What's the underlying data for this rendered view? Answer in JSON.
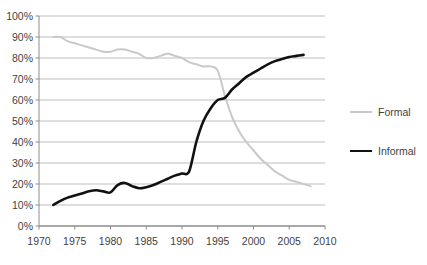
{
  "chart_data": {
    "type": "line",
    "title": "",
    "xlabel": "",
    "ylabel": "",
    "xlim": [
      1970,
      2010
    ],
    "ylim": [
      0,
      100
    ],
    "grid": true,
    "legend_position": "right",
    "x_ticks": [
      "1970",
      "1975",
      "1980",
      "1985",
      "1990",
      "1995",
      "2000",
      "2005",
      "2010"
    ],
    "y_ticks": [
      "0%",
      "10%",
      "20%",
      "30%",
      "40%",
      "50%",
      "60%",
      "70%",
      "80%",
      "90%",
      "100%"
    ],
    "series": [
      {
        "name": "Formal",
        "color": "#c9c9c9",
        "x": [
          1972,
          1973,
          1974,
          1975,
          1976,
          1977,
          1978,
          1979,
          1980,
          1981,
          1982,
          1983,
          1984,
          1985,
          1986,
          1987,
          1988,
          1989,
          1990,
          1991,
          1992,
          1993,
          1994,
          1995,
          1996,
          1997,
          1998,
          1999,
          2000,
          2001,
          2002,
          2003,
          2004,
          2005,
          2006,
          2007,
          2008
        ],
        "values": [
          90,
          90,
          88,
          87,
          86,
          85,
          84,
          83,
          83,
          84,
          84,
          83,
          82,
          80,
          80,
          81,
          82,
          81,
          80,
          78,
          77,
          76,
          76,
          74,
          62,
          52,
          45,
          40,
          36,
          32,
          29,
          26,
          24,
          22,
          21,
          20,
          19
        ]
      },
      {
        "name": "Informal",
        "color": "#111111",
        "x": [
          1972,
          1973,
          1974,
          1975,
          1976,
          1977,
          1978,
          1979,
          1980,
          1981,
          1982,
          1983,
          1984,
          1985,
          1986,
          1987,
          1988,
          1989,
          1990,
          1991,
          1992,
          1993,
          1994,
          1995,
          1996,
          1997,
          1998,
          1999,
          2000,
          2001,
          2002,
          2003,
          2004,
          2005,
          2006,
          2007
        ],
        "values": [
          10,
          12,
          13.5,
          14.5,
          15.5,
          16.5,
          17,
          16.5,
          16,
          19.5,
          20.5,
          19,
          18,
          18.5,
          19.5,
          21,
          22.5,
          24,
          25,
          26,
          40,
          50,
          56,
          60,
          61,
          65,
          68,
          71,
          73,
          75,
          77,
          78.5,
          79.5,
          80.5,
          81,
          81.5
        ]
      }
    ]
  },
  "legend": {
    "items": [
      {
        "label": "Formal"
      },
      {
        "label": "Informal"
      }
    ]
  }
}
